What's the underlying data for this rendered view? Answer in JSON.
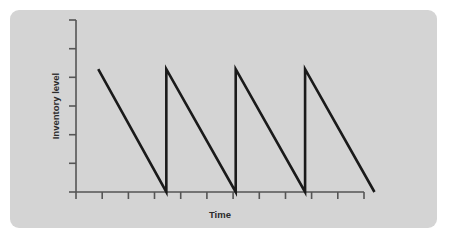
{
  "chart_data": {
    "type": "line",
    "title": "",
    "subtitle": "",
    "xlabel": "Time",
    "ylabel": "Inventory level",
    "grid": false,
    "legend": null,
    "xlim": [
      0,
      11
    ],
    "ylim": [
      0,
      7
    ],
    "x_tick_labels": [
      "",
      "",
      "",
      "",
      "",
      "",
      "",
      "",
      "",
      "",
      ""
    ],
    "y_tick_labels": [
      "",
      "",
      "",
      "",
      "",
      "",
      ""
    ],
    "x_tick_values": [
      0,
      1,
      2,
      3,
      4,
      5,
      6,
      7,
      8,
      9,
      10
    ],
    "y_tick_values": [
      0,
      1,
      2,
      3,
      4,
      5,
      6
    ],
    "annotations": [],
    "series": [
      {
        "name": "Inventory level",
        "color": "#1a1a1a",
        "points": [
          {
            "x": 0.85,
            "y": 5.0
          },
          {
            "x": 3.45,
            "y": 0.0
          },
          {
            "x": 3.45,
            "y": 5.0
          },
          {
            "x": 6.1,
            "y": 0.0
          },
          {
            "x": 6.1,
            "y": 5.0
          },
          {
            "x": 8.75,
            "y": 0.0
          },
          {
            "x": 8.75,
            "y": 5.0
          },
          {
            "x": 11.4,
            "y": 0.0
          }
        ]
      }
    ],
    "cycles": 4,
    "reorder_level": 0,
    "max_inventory": 5.0,
    "colors": {
      "panel_background": "#d4d4d4",
      "page_background": "#ffffff",
      "axis": "#555555",
      "series": "#1a1a1a",
      "text": "#2b2b2b"
    }
  }
}
